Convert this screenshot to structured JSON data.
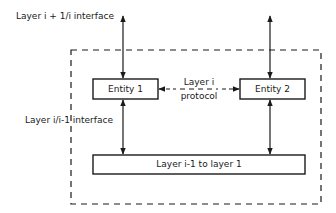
{
  "diagram": {
    "top_interface_label": "Layer i + 1/i interface",
    "lower_interface_label": "Layer i/i-1 interface",
    "entity_1": "Entity 1",
    "entity_2": "Entity 2",
    "protocol_line1": "Layer i",
    "protocol_line2": "protocol",
    "lower_layers": "Layer i-1 to layer 1"
  },
  "colors": {
    "stroke": "#1a1a1a",
    "background": "#ffffff"
  }
}
